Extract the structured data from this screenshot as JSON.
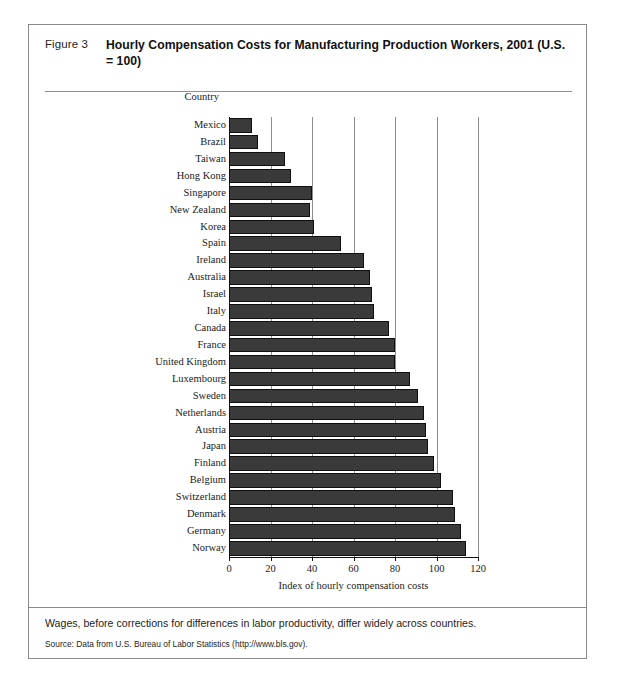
{
  "figure": {
    "number_label": "Figure 3",
    "title": "Hourly Compensation Costs for Manufacturing Production Workers, 2001 (U.S. = 100)",
    "caption": "Wages, before corrections for differences in labor productivity, differ widely across countries.",
    "source": "Source: Data from U.S. Bureau of Labor Statistics (http://www.bls.gov).",
    "category_axis_label": "Country"
  },
  "chart_data": {
    "type": "bar",
    "orientation": "horizontal",
    "title": "Hourly Compensation Costs for Manufacturing Production Workers, 2001 (U.S. = 100)",
    "xlabel": "Index of hourly compensation costs",
    "ylabel": "Country",
    "xlim": [
      0,
      120
    ],
    "xticks": [
      0,
      20,
      40,
      60,
      80,
      100,
      120
    ],
    "xticklabels": [
      "0",
      "20",
      "40",
      "60",
      "80",
      "100",
      "120"
    ],
    "grid": "vertical",
    "legend": null,
    "bar_color": "#3a3a3a",
    "categories": [
      "Mexico",
      "Brazil",
      "Taiwan",
      "Hong Kong",
      "Singapore",
      "New Zealand",
      "Korea",
      "Spain",
      "Ireland",
      "Australia",
      "Israel",
      "Italy",
      "Canada",
      "France",
      "United Kingdom",
      "Luxembourg",
      "Sweden",
      "Netherlands",
      "Austria",
      "Japan",
      "Finland",
      "Belgium",
      "Switzerland",
      "Denmark",
      "Germany",
      "Norway"
    ],
    "values": [
      11,
      14,
      27,
      30,
      40,
      39,
      41,
      54,
      65,
      68,
      69,
      70,
      77,
      80,
      80,
      87,
      91,
      94,
      95,
      96,
      99,
      102,
      108,
      109,
      112,
      114
    ]
  }
}
